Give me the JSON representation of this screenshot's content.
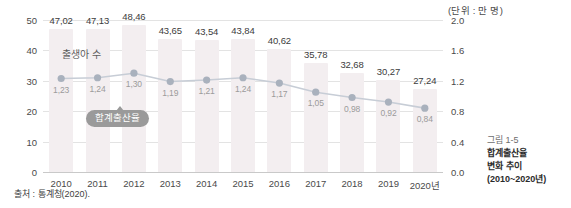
{
  "unit_note": "(단위 : 만 명)",
  "source": "출처 : 통계청(2020).",
  "series_labels": {
    "births": "출생아 수",
    "tfr": "합계출산율"
  },
  "caption": {
    "figure_number": "그림 1-5",
    "line1": "합계출산율",
    "line2": "변화 추이",
    "line3": "(2010~2020년)"
  },
  "colors": {
    "bar": "#f3eef0",
    "line": "#c7cdd6",
    "point": "#a9b1bd",
    "grid": "#e3e3e3",
    "axis": "#c9c9c9",
    "tooltip_bg": "#9a9a9a",
    "text": "#3f3f3f"
  },
  "chart_data": {
    "type": "bar",
    "title": "합계출산율 변화 추이 (2010~2020년)",
    "xlabel": "",
    "ylabel": "출생아 수",
    "y2label": "합계출산율",
    "categories": [
      "2010",
      "2011",
      "2012",
      "2013",
      "2014",
      "2015",
      "2016",
      "2017",
      "2018",
      "2019",
      "2020년"
    ],
    "ylim": [
      0,
      50
    ],
    "y2lim": [
      0,
      2.0
    ],
    "yticks": [
      "50",
      "40",
      "30",
      "20",
      "10",
      "0"
    ],
    "y2ticks": [
      "2.0",
      "1.6",
      "1.2",
      "0.8",
      "0.4",
      "0.0"
    ],
    "grid": true,
    "legend": "inline",
    "series": [
      {
        "name": "출생아 수",
        "type": "bar",
        "axis": "left",
        "unit": "만 명",
        "values": [
          47.02,
          47.13,
          48.46,
          43.65,
          43.54,
          43.84,
          40.62,
          35.78,
          32.68,
          30.27,
          27.24
        ],
        "labels": [
          "47,02",
          "47,13",
          "48,46",
          "43,65",
          "43,54",
          "43,84",
          "40,62",
          "35,78",
          "32,68",
          "30,27",
          "27,24"
        ]
      },
      {
        "name": "합계출산율",
        "type": "line",
        "axis": "right",
        "values": [
          1.23,
          1.24,
          1.3,
          1.19,
          1.21,
          1.24,
          1.17,
          1.05,
          0.98,
          0.92,
          0.84
        ],
        "labels": [
          "1,23",
          "1,24",
          "1,30",
          "1,19",
          "1,21",
          "1,24",
          "1,17",
          "1,05",
          "0,98",
          "0,92",
          "0,84"
        ]
      }
    ]
  }
}
